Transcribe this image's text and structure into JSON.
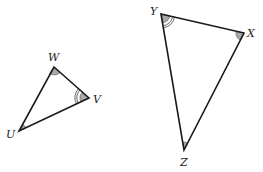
{
  "diagram": {
    "type": "similar-triangles",
    "triangles": [
      {
        "name": "triangle-UWV",
        "vertices": [
          {
            "label": "W",
            "x": 54,
            "y": 67,
            "angle_marks": 1
          },
          {
            "label": "V",
            "x": 89,
            "y": 98,
            "angle_marks": 3
          },
          {
            "label": "U",
            "x": 19,
            "y": 131,
            "angle_marks": 1
          }
        ]
      },
      {
        "name": "triangle-XYZ",
        "vertices": [
          {
            "label": "Y",
            "x": 161,
            "y": 14,
            "angle_marks": 3
          },
          {
            "label": "X",
            "x": 244,
            "y": 33,
            "angle_marks": 1
          },
          {
            "label": "Z",
            "x": 184,
            "y": 150,
            "angle_marks": 1
          }
        ]
      }
    ]
  },
  "labels": {
    "W": "W",
    "V": "V",
    "U": "U",
    "Y": "Y",
    "X": "X",
    "Z": "Z"
  }
}
